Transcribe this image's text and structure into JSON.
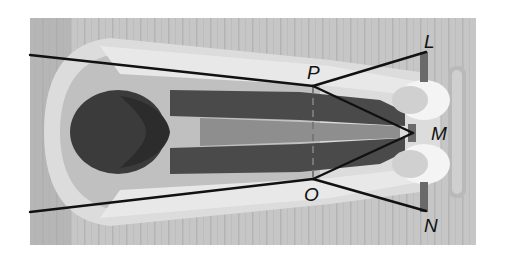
{
  "figure": {
    "colors": {
      "background": "#ffffff",
      "floor": "#c4c4c4",
      "floor_stripe": "#b8b8b8",
      "mat": "#d2d2d2",
      "body_light": "#dedede",
      "body_mid": "#b0b0b0",
      "hair": "#3a3a3a",
      "legs_dark": "#4a4a4a",
      "feet": "#f4f4f4",
      "block": "#a6a6a6",
      "line": "#111111"
    }
  },
  "points": {
    "P": {
      "label": "P",
      "x": 313,
      "y": 86
    },
    "O": {
      "label": "O",
      "x": 313,
      "y": 179
    },
    "L": {
      "label": "L",
      "x": 426,
      "y": 52
    },
    "N": {
      "label": "N",
      "x": 426,
      "y": 211
    },
    "M": {
      "label": "M",
      "x": 413,
      "y": 133
    }
  },
  "segments": [
    {
      "from": "left-top",
      "to": "P"
    },
    {
      "from": "P",
      "to": "L"
    },
    {
      "from": "P",
      "to": "M"
    },
    {
      "from": "left-bottom",
      "to": "O"
    },
    {
      "from": "O",
      "to": "N"
    },
    {
      "from": "O",
      "to": "M"
    },
    {
      "from": "P",
      "to": "O",
      "style": "dashed"
    }
  ]
}
